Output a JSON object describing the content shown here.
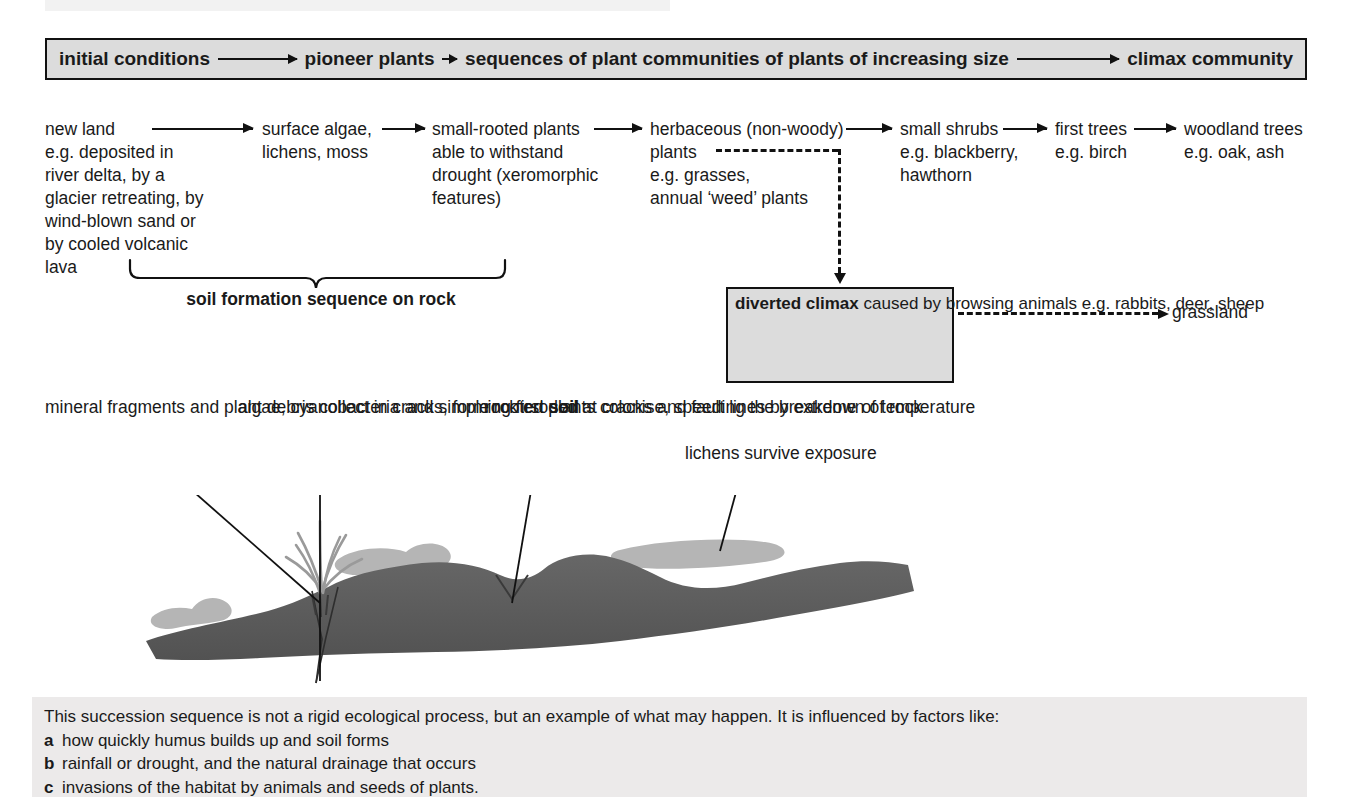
{
  "banner": {
    "segments": [
      {
        "label": "initial conditions",
        "arrow": "long"
      },
      {
        "label": "pioneer plants",
        "arrow": "short"
      },
      {
        "label": "sequences of plant communities of plants of increasing size",
        "arrow": "xlong"
      },
      {
        "label": "climax community",
        "arrow": "none"
      }
    ]
  },
  "succession": {
    "stages": [
      {
        "name": "new-land",
        "lines": [
          "new land",
          "e.g. deposited in",
          "river delta, by a",
          "glacier retreating, by",
          "wind-blown sand or",
          "by cooled volcanic",
          "lava"
        ]
      },
      {
        "name": "surface-algae",
        "lines": [
          "surface algae,",
          "lichens, moss"
        ]
      },
      {
        "name": "small-rooted-plants",
        "lines": [
          "small-rooted plants",
          "able to withstand",
          "drought (xeromorphic",
          "features)"
        ]
      },
      {
        "name": "herbaceous-plants",
        "lines": [
          "herbaceous (non-woody)",
          "plants",
          "e.g. grasses,",
          "annual ‘weed’ plants"
        ]
      },
      {
        "name": "small-shrubs",
        "lines": [
          "small shrubs",
          "e.g. blackberry,",
          "hawthorn"
        ]
      },
      {
        "name": "first-trees",
        "lines": [
          "first trees",
          "e.g. birch"
        ]
      },
      {
        "name": "woodland-trees",
        "lines": [
          "woodland trees",
          "e.g. oak, ash"
        ]
      }
    ]
  },
  "brace_label": {
    "lines": [
      "soil formation",
      "sequence",
      "on rock"
    ]
  },
  "diverted_climax": {
    "heading": "diverted climax",
    "lines": [
      "caused by",
      "browsing animals",
      "e.g. rabbits, deer, sheep"
    ],
    "outcome": "grassland"
  },
  "annotations": [
    {
      "name": "mineral-fragments",
      "lines": [
        "mineral fragments",
        "and plant debris",
        "collect in cracks,"
      ],
      "last_plain": "forming first ",
      "last_bold": "soil"
    },
    {
      "name": "algae-cyanobacteria",
      "lines": [
        "algae, cyanobacteria",
        "and simple rooted plants",
        "colonise, speeding the",
        "breakdown of rock"
      ]
    },
    {
      "name": "rock-eroded",
      "lines": [
        "rock eroded at",
        "cracks and fault",
        "lines by extreme",
        "of temperature"
      ]
    },
    {
      "name": "lichens-survive",
      "lines": [
        "lichens survive",
        "exposure"
      ]
    }
  ],
  "caption": {
    "lead": "This succession sequence is not a rigid ecological process, but an example of what may happen. It is influenced by factors like:",
    "items": [
      {
        "marker": "a",
        "text": "how quickly humus builds up and soil forms"
      },
      {
        "marker": "b",
        "text": "rainfall or drought, and the natural drainage that occurs"
      },
      {
        "marker": "c",
        "text": "invasions of the habitat by animals and seeds of plants."
      }
    ]
  },
  "colors": {
    "banner_fill": "#dcdcdc",
    "box_fill": "#dcdcdc",
    "caption_fill": "#eceaea",
    "rock_dark": "#595959",
    "lichen_grey": "#b3b3b3",
    "plant_grey": "#9e9e9e",
    "stroke": "#111111"
  }
}
